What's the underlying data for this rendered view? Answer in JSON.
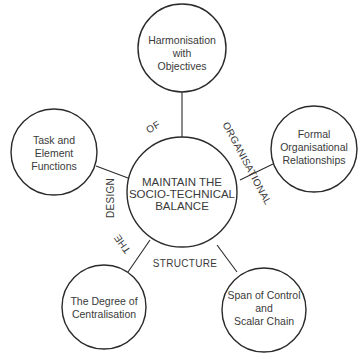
{
  "diagram": {
    "center": {
      "lines": [
        "MAINTAIN THE",
        "SOCIO-TECHNICAL",
        "BALANCE"
      ]
    },
    "nodes": [
      {
        "id": "top",
        "lines": [
          "Harmonisation",
          "with",
          "Objectives"
        ]
      },
      {
        "id": "left",
        "lines": [
          "Task and",
          "Element",
          "Functions"
        ]
      },
      {
        "id": "right",
        "lines": [
          "Formal",
          "Organisational",
          "Relationships"
        ]
      },
      {
        "id": "bottom-left",
        "lines": [
          "The Degree of",
          "Centralisation"
        ]
      },
      {
        "id": "bottom-right",
        "lines": [
          "Span of Control",
          "and",
          "Scalar Chain"
        ]
      }
    ],
    "ring_words": {
      "design": "DESIGN",
      "of": "OF",
      "organisational": "ORGANISATIONAL",
      "the": "THE",
      "structure": "STRUCTURE"
    }
  }
}
